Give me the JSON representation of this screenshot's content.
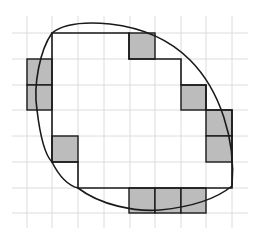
{
  "figure": {
    "grid": {
      "origin": [
        27,
        33
      ],
      "cell_size": 25.7,
      "columns_x": [
        27,
        52,
        78,
        104,
        130,
        155,
        181,
        206,
        232
      ],
      "rows_y": [
        33,
        59,
        85,
        110,
        136,
        162,
        188,
        213
      ],
      "extent": {
        "x0": 12,
        "y0": 16,
        "x1": 248,
        "y1": 228
      },
      "line_color": "#dcdcdc"
    },
    "polygon": {
      "points": [
        [
          52,
          33
        ],
        [
          129,
          33
        ],
        [
          129,
          59
        ],
        [
          155,
          59
        ],
        [
          181,
          59
        ],
        [
          181,
          85
        ],
        [
          206,
          85
        ],
        [
          206,
          110
        ],
        [
          232,
          110
        ],
        [
          232,
          188
        ],
        [
          206,
          188
        ],
        [
          78,
          188
        ],
        [
          78,
          162
        ],
        [
          52,
          162
        ]
      ],
      "stroke": "#1a1a1a"
    },
    "shaded_cells": [
      {
        "x": 27,
        "y": 59,
        "w": 25,
        "h": 26
      },
      {
        "x": 27,
        "y": 85,
        "w": 25,
        "h": 25
      },
      {
        "x": 129,
        "y": 33,
        "w": 26,
        "h": 26
      },
      {
        "x": 181,
        "y": 85,
        "w": 25,
        "h": 25
      },
      {
        "x": 206,
        "y": 110,
        "w": 26,
        "h": 26
      },
      {
        "x": 206,
        "y": 136,
        "w": 26,
        "h": 26
      },
      {
        "x": 52,
        "y": 136,
        "w": 26,
        "h": 26
      },
      {
        "x": 129,
        "y": 188,
        "w": 26,
        "h": 25
      },
      {
        "x": 155,
        "y": 188,
        "w": 26,
        "h": 25
      },
      {
        "x": 181,
        "y": 188,
        "w": 25,
        "h": 25
      }
    ],
    "shade_color": "#bcbcbc",
    "curve": {
      "path": "M 232 186 C 236 140, 220 90, 190 60 C 170 40, 145 28, 110 24 C 80 21, 62 25, 52 33 C 40 50, 33 85, 37 110 C 40 135, 45 155, 52 162 C 60 178, 70 186, 78 188 C 100 205, 135 212, 160 210 C 190 207, 215 200, 232 186 Z",
      "stroke": "#1a1a1a"
    }
  }
}
